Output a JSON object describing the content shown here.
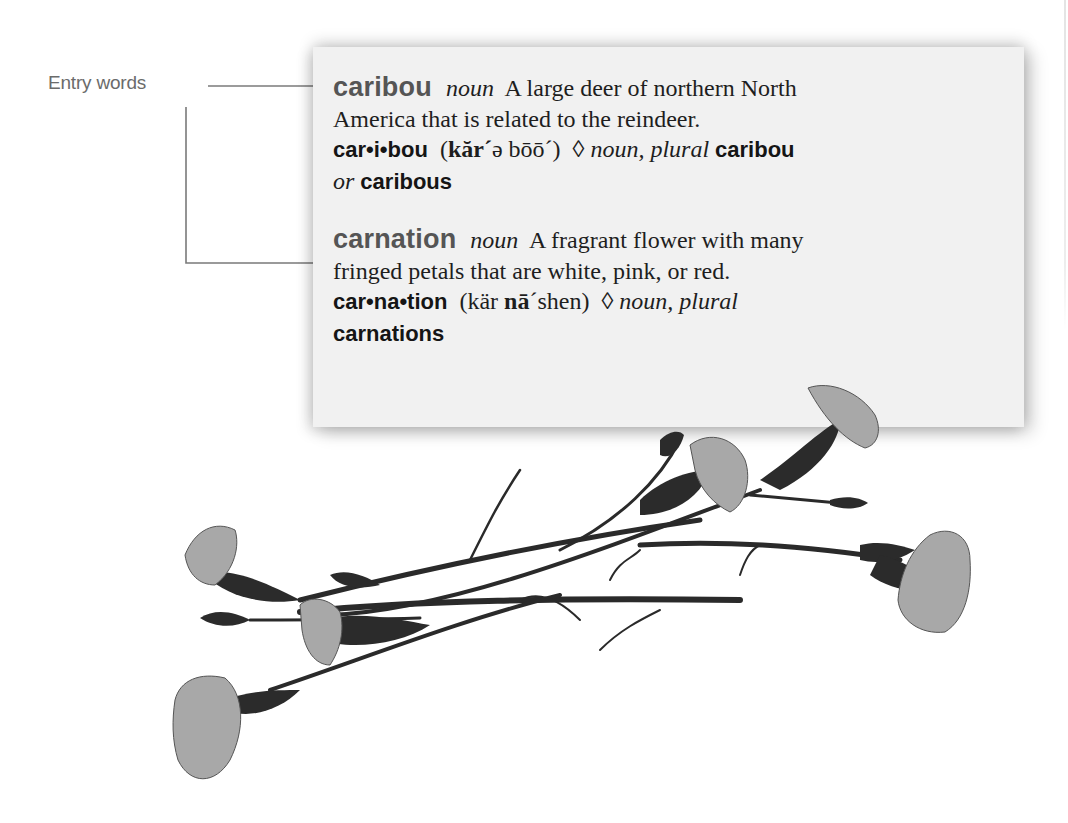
{
  "callout": {
    "label": "Entry words",
    "line_color": "#7a7a7a"
  },
  "card": {
    "background": "#f1f1f1",
    "entries": [
      {
        "headword": "caribou",
        "part_of_speech": "noun",
        "definition_line1": "A large deer of northern North",
        "definition_line2": "America that is related to the reindeer.",
        "syllables": "car•i•bou",
        "pron_open": "(",
        "pron_bold": "kăr´",
        "pron_rest": "ə bōō´)",
        "diamond": "◊",
        "inflection_label": "noun, plural",
        "plural_1": "caribou",
        "or_label": "or",
        "plural_2": "caribous"
      },
      {
        "headword": "carnation",
        "part_of_speech": "noun",
        "definition_line1": "A fragrant flower with many",
        "definition_line2": "fringed petals that are white, pink, or red.",
        "syllables": "car•na•tion",
        "pron_open": "(kär",
        "pron_bold": "nā",
        "pron_rest": "´shen)",
        "diamond": "◊",
        "inflection_label": "noun, plural",
        "plural_1": "carnations"
      }
    ]
  },
  "illustration": {
    "subject": "carnation-flowers-photo",
    "tone": "grayscale"
  }
}
